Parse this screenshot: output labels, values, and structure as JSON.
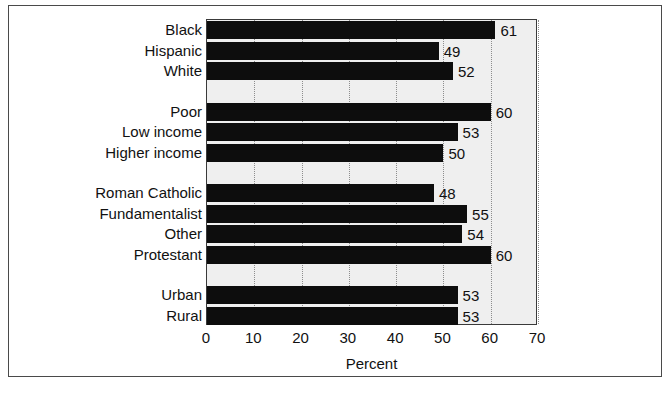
{
  "chart_data": {
    "type": "bar",
    "orientation": "horizontal",
    "title": "",
    "xlabel": "Percent",
    "ylabel": "",
    "xlim": [
      0,
      70
    ],
    "xticks": [
      0,
      10,
      20,
      30,
      40,
      50,
      60,
      70
    ],
    "grid": "vertical-dotted",
    "legend": "none",
    "bar_color": "#0d0d0d",
    "plot_background": "#efefef",
    "categories": [
      "Black",
      "Hispanic",
      "White",
      "Poor",
      "Low income",
      "Higher income",
      "Roman Catholic",
      "Fundamentalist",
      "Other",
      "Protestant",
      "Urban",
      "Rural"
    ],
    "values": [
      61,
      49,
      52,
      60,
      53,
      50,
      48,
      55,
      54,
      60,
      53,
      53
    ],
    "groups": [
      {
        "name": "race",
        "categories": [
          "Black",
          "Hispanic",
          "White"
        ],
        "values": [
          61,
          49,
          52
        ]
      },
      {
        "name": "income",
        "categories": [
          "Poor",
          "Low income",
          "Higher income"
        ],
        "values": [
          60,
          53,
          50
        ]
      },
      {
        "name": "religion",
        "categories": [
          "Roman Catholic",
          "Fundamentalist",
          "Other",
          "Protestant"
        ],
        "values": [
          48,
          55,
          54,
          60
        ]
      },
      {
        "name": "residence",
        "categories": [
          "Urban",
          "Rural"
        ],
        "values": [
          53,
          53
        ]
      }
    ],
    "bars": [
      {
        "label": "Black",
        "value": 61,
        "slot": 0
      },
      {
        "label": "Hispanic",
        "value": 49,
        "slot": 1
      },
      {
        "label": "White",
        "value": 52,
        "slot": 2
      },
      {
        "label": "Poor",
        "value": 60,
        "slot": 4
      },
      {
        "label": "Low income",
        "value": 53,
        "slot": 5
      },
      {
        "label": "Higher income",
        "value": 50,
        "slot": 6
      },
      {
        "label": "Roman Catholic",
        "value": 48,
        "slot": 8
      },
      {
        "label": "Fundamentalist",
        "value": 55,
        "slot": 9
      },
      {
        "label": "Other",
        "value": 54,
        "slot": 10
      },
      {
        "label": "Protestant",
        "value": 60,
        "slot": 11
      },
      {
        "label": "Urban",
        "value": 53,
        "slot": 13
      },
      {
        "label": "Rural",
        "value": 53,
        "slot": 14
      }
    ],
    "total_slots": 15
  }
}
